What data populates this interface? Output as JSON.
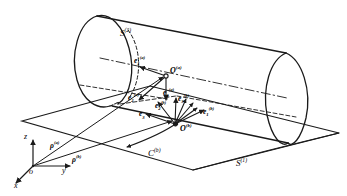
{
  "figure": {
    "width": 347,
    "height": 196,
    "stroke_color": "#1a1a1a",
    "background_color": "#ffffff"
  },
  "surfaces": {
    "cylinder": {
      "name": "S2",
      "base": "S",
      "superscript": "(2)"
    },
    "plane": {
      "name": "S1",
      "base": "S",
      "superscript": "(1)"
    }
  },
  "curve": {
    "base": "C",
    "superscript": "(b)"
  },
  "points": [
    {
      "id": "origin",
      "base": "o",
      "superscript": ""
    },
    {
      "id": "Oa",
      "base": "O",
      "superscript": "(a)"
    },
    {
      "id": "Ob",
      "base": "O",
      "superscript": "(b)"
    }
  ],
  "axes": [
    {
      "id": "axis-x",
      "label": "x"
    },
    {
      "id": "axis-y",
      "label": "y"
    },
    {
      "id": "axis-z",
      "label": "z"
    }
  ],
  "position_vectors": [
    {
      "id": "rho-a",
      "base": "ρ",
      "superscript": "(a)"
    },
    {
      "id": "rho-b",
      "base": "ρ",
      "superscript": "(b)"
    }
  ],
  "frame_vectors": [
    {
      "id": "e1a",
      "base": "e",
      "subscript": "1",
      "superscript": "(a)"
    },
    {
      "id": "e2a",
      "base": "e",
      "subscript": "2",
      "superscript": "(a)"
    },
    {
      "id": "e3a",
      "base": "e",
      "subscript": "3",
      "superscript": "(a)"
    },
    {
      "id": "e1b",
      "base": "e",
      "subscript": "1",
      "superscript": "(b)"
    },
    {
      "id": "e2b",
      "base": "e",
      "subscript": "2",
      "superscript": "(b)"
    },
    {
      "id": "e3b",
      "base": "e",
      "subscript": "3",
      "superscript": "(b)"
    },
    {
      "id": "e3-plain",
      "base": "e",
      "subscript": "3",
      "superscript": ""
    }
  ]
}
